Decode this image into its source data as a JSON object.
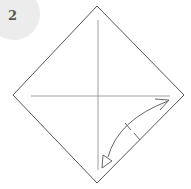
{
  "diagram": {
    "type": "origami-step",
    "step_number": "2",
    "shape": "square-on-point",
    "crease_lines": [
      "vertical-center",
      "horizontal-center"
    ],
    "action": "fold right edge to center and unfold",
    "colors": {
      "line": "#555555",
      "crease": "#888888",
      "badge": "#ececec"
    }
  }
}
